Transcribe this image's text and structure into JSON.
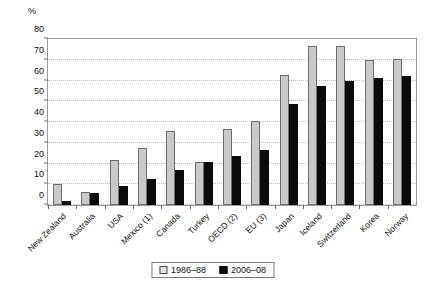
{
  "chart_data": {
    "type": "bar",
    "title": "",
    "subtitle": "",
    "xlabel": "",
    "ylabel": "%",
    "ylim": [
      0,
      80
    ],
    "yticks": [
      0,
      10,
      20,
      30,
      40,
      50,
      60,
      70,
      80
    ],
    "grid": true,
    "legend_position": "bottom",
    "categories": [
      "New Zealand",
      "Australia",
      "USA",
      "Mexico (1)",
      "Canada",
      "Turkey",
      "OECD (2)",
      "EU (3)",
      "Japan",
      "Iceland",
      "Switzerland",
      "Korea",
      "Norway"
    ],
    "series": [
      {
        "name": "1986–88",
        "color": "#c9c9c9",
        "values": [
          10,
          6.5,
          21.5,
          27.5,
          35.5,
          20.5,
          36.5,
          40.5,
          62.5,
          76.5,
          76.5,
          70,
          70.5
        ]
      },
      {
        "name": "2006–08",
        "color": "#0a0a0a",
        "values": [
          2,
          6,
          9,
          12.5,
          17,
          20.5,
          23.5,
          26.5,
          48.5,
          57.5,
          60,
          61,
          62
        ]
      }
    ]
  },
  "legend": {
    "items": [
      {
        "label": "1986–88",
        "swatch": "old"
      },
      {
        "label": "2006–08",
        "swatch": "new"
      }
    ]
  }
}
